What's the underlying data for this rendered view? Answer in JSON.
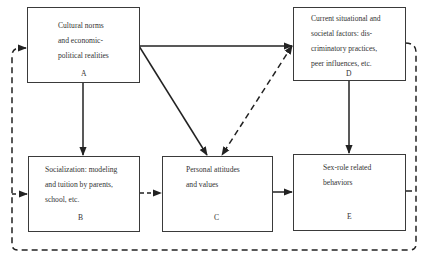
{
  "diagram": {
    "nodes": [
      {
        "id": "A",
        "lines": [
          "Cultural norms",
          "and economic-",
          "political realities"
        ],
        "label": "A"
      },
      {
        "id": "D",
        "lines": [
          "Current situational and",
          "societal factors: dis-",
          "criminatory practices,",
          "peer influences, etc."
        ],
        "label": "D"
      },
      {
        "id": "B",
        "lines": [
          "Socialization: modeling",
          "and tuition by parents,",
          "school, etc."
        ],
        "label": "B"
      },
      {
        "id": "C",
        "lines": [
          "Personal attitudes",
          "and values"
        ],
        "label": "C"
      },
      {
        "id": "E",
        "lines": [
          "Sex-role related",
          "behaviors"
        ],
        "label": "E"
      }
    ],
    "edges": [
      {
        "from": "A",
        "to": "D",
        "style": "solid"
      },
      {
        "from": "A",
        "to": "B",
        "style": "solid"
      },
      {
        "from": "A",
        "to": "C",
        "style": "solid"
      },
      {
        "from": "C",
        "to": "D",
        "style": "dashed"
      },
      {
        "from": "D",
        "to": "E",
        "style": "solid"
      },
      {
        "from": "B",
        "to": "C",
        "style": "dashed"
      },
      {
        "from": "C",
        "to": "E",
        "style": "solid"
      },
      {
        "from": "E",
        "to": "A",
        "style": "dashed",
        "note": "feedback loop"
      },
      {
        "from": "E",
        "to": "B",
        "style": "dashed",
        "note": "feedback loop"
      },
      {
        "from": "D",
        "to": "loop",
        "style": "dashed"
      }
    ]
  }
}
